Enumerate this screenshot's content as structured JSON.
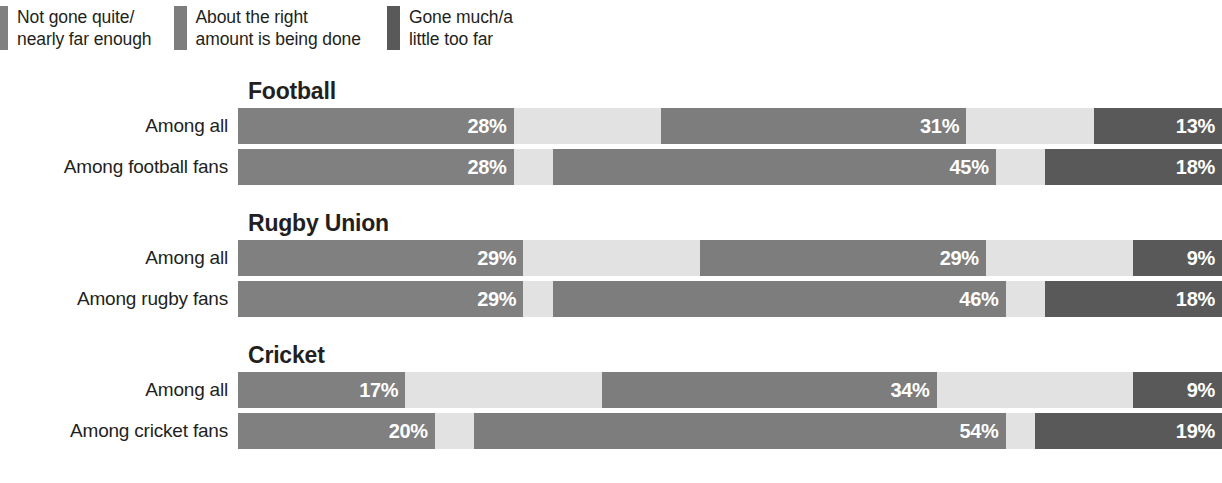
{
  "legend": {
    "items": [
      {
        "label": "Not gone quite/\nnearly far enough",
        "color": "#808080",
        "key": "not_far_enough"
      },
      {
        "label": "About the right\namount is being done",
        "color": "#7d7d7d",
        "key": "about_right"
      },
      {
        "label": "Gone much/a\nlittle too far",
        "color": "#595959",
        "key": "too_far"
      }
    ]
  },
  "colors": {
    "not_far_enough": "#808080",
    "neutral_gap": "#e2e2e2",
    "about_right": "#7d7d7d",
    "too_far": "#595959",
    "background": "#ffffff",
    "text": "#231f20",
    "bar_label": "#ffffff"
  },
  "sections": [
    {
      "title": "Football",
      "rows": [
        {
          "label": "Among all",
          "segments": [
            {
              "key": "not_far_enough",
              "value": 28,
              "label": "28%",
              "show_label": true
            },
            {
              "key": "neutral_gap",
              "value": 15,
              "label": "",
              "show_label": false
            },
            {
              "key": "about_right",
              "value": 31,
              "label": "31%",
              "show_label": true
            },
            {
              "key": "neutral_gap",
              "value": 13,
              "label": "",
              "show_label": false
            },
            {
              "key": "too_far",
              "value": 13,
              "label": "13%",
              "show_label": true
            }
          ]
        },
        {
          "label": "Among football fans",
          "segments": [
            {
              "key": "not_far_enough",
              "value": 28,
              "label": "28%",
              "show_label": true
            },
            {
              "key": "neutral_gap",
              "value": 4,
              "label": "",
              "show_label": false
            },
            {
              "key": "about_right",
              "value": 45,
              "label": "45%",
              "show_label": true
            },
            {
              "key": "neutral_gap",
              "value": 5,
              "label": "",
              "show_label": false
            },
            {
              "key": "too_far",
              "value": 18,
              "label": "18%",
              "show_label": true
            }
          ]
        }
      ]
    },
    {
      "title": "Rugby Union",
      "rows": [
        {
          "label": "Among all",
          "segments": [
            {
              "key": "not_far_enough",
              "value": 29,
              "label": "29%",
              "show_label": true
            },
            {
              "key": "neutral_gap",
              "value": 18,
              "label": "",
              "show_label": false
            },
            {
              "key": "about_right",
              "value": 29,
              "label": "29%",
              "show_label": true
            },
            {
              "key": "neutral_gap",
              "value": 15,
              "label": "",
              "show_label": false
            },
            {
              "key": "too_far",
              "value": 9,
              "label": "9%",
              "show_label": true
            }
          ]
        },
        {
          "label": "Among rugby fans",
          "segments": [
            {
              "key": "not_far_enough",
              "value": 29,
              "label": "29%",
              "show_label": true
            },
            {
              "key": "neutral_gap",
              "value": 3,
              "label": "",
              "show_label": false
            },
            {
              "key": "about_right",
              "value": 46,
              "label": "46%",
              "show_label": true
            },
            {
              "key": "neutral_gap",
              "value": 4,
              "label": "",
              "show_label": false
            },
            {
              "key": "too_far",
              "value": 18,
              "label": "18%",
              "show_label": true
            }
          ]
        }
      ]
    },
    {
      "title": "Cricket",
      "rows": [
        {
          "label": "Among all",
          "segments": [
            {
              "key": "not_far_enough",
              "value": 17,
              "label": "17%",
              "show_label": true
            },
            {
              "key": "neutral_gap",
              "value": 20,
              "label": "",
              "show_label": false
            },
            {
              "key": "about_right",
              "value": 34,
              "label": "34%",
              "show_label": true
            },
            {
              "key": "neutral_gap",
              "value": 20,
              "label": "",
              "show_label": false
            },
            {
              "key": "too_far",
              "value": 9,
              "label": "9%",
              "show_label": true
            }
          ]
        },
        {
          "label": "Among cricket fans",
          "segments": [
            {
              "key": "not_far_enough",
              "value": 20,
              "label": "20%",
              "show_label": true
            },
            {
              "key": "neutral_gap",
              "value": 4,
              "label": "",
              "show_label": false
            },
            {
              "key": "about_right",
              "value": 54,
              "label": "54%",
              "show_label": true
            },
            {
              "key": "neutral_gap",
              "value": 3,
              "label": "",
              "show_label": false
            },
            {
              "key": "too_far",
              "value": 19,
              "label": "19%",
              "show_label": true
            }
          ]
        }
      ]
    }
  ],
  "chart_data": {
    "type": "bar",
    "orientation": "horizontal",
    "stacked": true,
    "title": "",
    "xlabel": "",
    "ylabel": "",
    "xlim": [
      0,
      100
    ],
    "grid": false,
    "legend_position": "top-left",
    "legend_entries": [
      "Not gone quite/nearly far enough",
      "About the right amount is being done",
      "Gone much/a little too far"
    ],
    "groups": [
      "Football",
      "Rugby Union",
      "Cricket"
    ],
    "categories": [
      "Football — Among all",
      "Football — Among football fans",
      "Rugby Union — Among all",
      "Rugby Union — Among rugby fans",
      "Cricket — Among all",
      "Cricket — Among cricket fans"
    ],
    "series": [
      {
        "name": "Not gone quite/nearly far enough",
        "color": "#808080",
        "values": [
          28,
          28,
          29,
          29,
          17,
          20
        ]
      },
      {
        "name": "About the right amount is being done",
        "color": "#7d7d7d",
        "values": [
          31,
          45,
          29,
          46,
          34,
          54
        ]
      },
      {
        "name": "Gone much/a little too far",
        "color": "#595959",
        "values": [
          13,
          18,
          9,
          18,
          9,
          19
        ]
      }
    ],
    "data_labels": [
      [
        "28%",
        "31%",
        "13%"
      ],
      [
        "28%",
        "45%",
        "18%"
      ],
      [
        "29%",
        "29%",
        "9%"
      ],
      [
        "29%",
        "46%",
        "18%"
      ],
      [
        "17%",
        "34%",
        "9%"
      ],
      [
        "20%",
        "54%",
        "19%"
      ]
    ]
  }
}
